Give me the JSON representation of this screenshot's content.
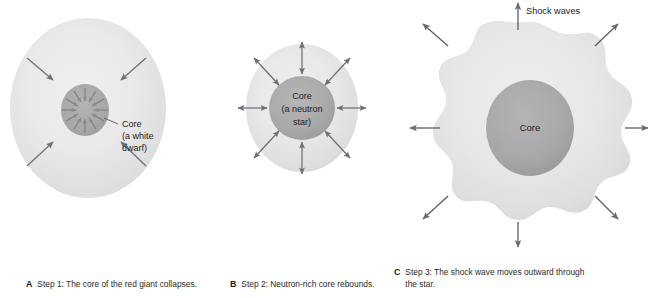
{
  "figure": {
    "colors": {
      "envelope_outer": "#e9e9e9",
      "envelope_mid": "#e2e2e2",
      "core_gray": "#a9a9a9",
      "core_dark": "#9d9d9d",
      "arrow_gray": "#6e6e78",
      "text": "#1d1d1d",
      "background": "#ffffff"
    }
  },
  "panels": [
    {
      "letter": "A",
      "caption": "Step 1: The core of the red giant collapses.",
      "labels": {
        "core": "Core",
        "core_sub1": "(a white",
        "core_sub2": "dwarf)"
      },
      "arrow_direction": "inward",
      "outer_arrow_count": 4,
      "core_arrow_count": 12
    },
    {
      "letter": "B",
      "caption": "Step 2: Neutron-rich core rebounds.",
      "labels": {
        "core": "Core",
        "core_sub1": "(a neutron",
        "core_sub2": "star)"
      },
      "arrow_direction": "bidirectional",
      "outer_arrow_count": 8,
      "core_arrow_count": 0
    },
    {
      "letter": "C",
      "caption": "Step 3: The shock wave moves outward through the star.",
      "labels": {
        "core": "Core",
        "shock_waves": "Shock waves"
      },
      "arrow_direction": "outward",
      "outer_arrow_count": 8,
      "core_arrow_count": 0
    }
  ]
}
